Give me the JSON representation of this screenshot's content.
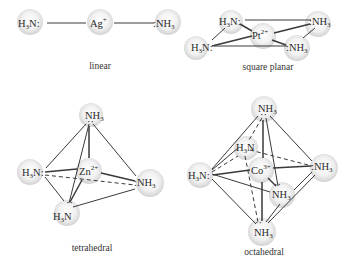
{
  "figure": {
    "panels": [
      {
        "id": "linear",
        "caption": "linear",
        "metal": {
          "symbol": "Ag",
          "charge": "+"
        },
        "ligands": [
          "H3N:",
          ":NH3"
        ]
      },
      {
        "id": "square-planar",
        "caption": "square planar",
        "metal": {
          "symbol": "Pt",
          "charge": "2+"
        },
        "ligands": [
          "H3N:",
          ":NH3",
          "H3N:",
          ":NH3"
        ]
      },
      {
        "id": "tetrahedral",
        "caption": "tetrahedral",
        "metal": {
          "symbol": "Zn",
          "charge": "2+"
        },
        "ligands": [
          "NH3",
          "H3N:",
          ":NH3",
          "H3N"
        ]
      },
      {
        "id": "octahedral",
        "caption": "octahedral",
        "metal": {
          "symbol": "Co",
          "charge": "3+"
        },
        "ligands": [
          "NH3",
          "H3N",
          "H3N:",
          ":NH3",
          "NH3",
          "NH3"
        ]
      }
    ]
  },
  "text": {
    "ligand_left": "H",
    "ligand_right": "NH",
    "three": "3",
    "n_colon": "N:",
    "colon_nh": ":NH",
    "n": "N",
    "ag": "Ag",
    "ag_charge": "+",
    "pt": "Pt",
    "pt_charge": "2+",
    "zn": "Zn",
    "zn_charge": "2+",
    "co": "Co",
    "co_charge": "3+",
    "lone_pair": "··",
    "cap_linear": "linear",
    "cap_square": "square planar",
    "cap_tetra": "tetrahedral",
    "cap_octa": "octahedral"
  },
  "colors": {
    "sphere_center": "#ffffff",
    "sphere_edge": "#d4d4d4",
    "line": "#3a3a3a",
    "text": "#2a2a2a"
  }
}
